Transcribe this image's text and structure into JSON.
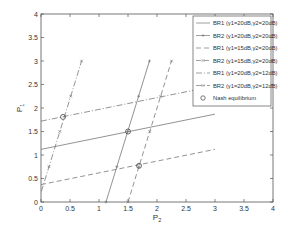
{
  "chart_data": {
    "type": "line",
    "title": "",
    "xlabel": "P2",
    "ylabel": "P1",
    "xlim": [
      0,
      4
    ],
    "ylim": [
      0,
      4
    ],
    "xticks": [
      "0",
      "0.5",
      "1",
      "1.5",
      "2",
      "2.5",
      "3",
      "3.5",
      "4"
    ],
    "yticks": [
      "0",
      "0.5",
      "1",
      "1.5",
      "2",
      "2.5",
      "3",
      "3.5",
      "4"
    ],
    "grid": false,
    "legend_position": "upper right",
    "series": [
      {
        "name": "BR1 (γ1=20dB,γ2=20dB)",
        "style": "solid",
        "marker": "none",
        "points": [
          [
            0,
            1.12
          ],
          [
            3,
            1.87
          ]
        ]
      },
      {
        "name": "BR2 (γ1=20dB,γ2=20dB)",
        "style": "solid",
        "marker": "+",
        "points": [
          [
            1.12,
            0
          ],
          [
            1.87,
            3
          ]
        ]
      },
      {
        "name": "BR1 (γ1=15dB,γ2=20dB)",
        "style": "dashed",
        "marker": "none",
        "points": [
          [
            0,
            0.37
          ],
          [
            3,
            1.12
          ]
        ]
      },
      {
        "name": "BR2 (γ1=15dB,γ2=20dB)",
        "style": "dashed",
        "marker": "x",
        "points": [
          [
            1.5,
            0
          ],
          [
            2.25,
            3
          ]
        ]
      },
      {
        "name": "BR1 (γ1=20dB,γ2=12dB)",
        "style": "dashdot",
        "marker": "none",
        "points": [
          [
            0,
            1.72
          ],
          [
            3,
            2.47
          ]
        ]
      },
      {
        "name": "BR2 (γ1=20dB,γ2=12dB)",
        "style": "dashdot",
        "marker": "x",
        "points": [
          [
            -0.05,
            0
          ],
          [
            0.7,
            3
          ]
        ]
      }
    ],
    "nash_equilibria": [
      [
        1.5,
        1.5
      ],
      [
        1.69,
        0.77
      ],
      [
        0.38,
        1.81
      ]
    ],
    "legend": [
      "BR1 (γ1=20dB,γ2=20dB)",
      "BR2 (γ1=20dB,γ2=20dB)",
      "BR1 (γ1=15dB,γ2=20dB)",
      "BR2 (γ1=15dB,γ2=20dB)",
      "BR1 (γ1=20dB,γ2=12dB)",
      "BR2 (γ1=20dB,γ2=12dB)",
      "Nash equilibrium"
    ]
  }
}
